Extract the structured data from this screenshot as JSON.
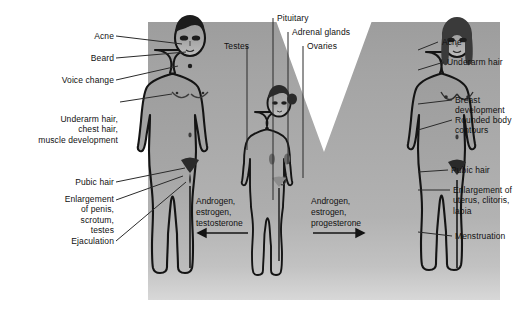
{
  "figure": {
    "background_color": "#a8a8a8",
    "page_background": "#ffffff",
    "outline_color": "#111111"
  },
  "left_labels": [
    {
      "id": "acne",
      "text": "Acne"
    },
    {
      "id": "beard",
      "text": "Beard"
    },
    {
      "id": "voice-change",
      "text": "Voice change"
    },
    {
      "id": "underarm-hair",
      "text": "Underarm hair,\nchest hair,\nmuscle development"
    },
    {
      "id": "pubic-hair",
      "text": "Pubic hair"
    },
    {
      "id": "enlargement",
      "text": "Enlargement\nof penis,\nscrotum,\ntestes"
    },
    {
      "id": "ejaculation",
      "text": "Ejaculation"
    }
  ],
  "right_labels": [
    {
      "id": "acne",
      "text": "Acne"
    },
    {
      "id": "underarm-hair",
      "text": "Underarm hair"
    },
    {
      "id": "breast-development",
      "text": "Breast\ndevelopment"
    },
    {
      "id": "rounded-body-contours",
      "text": "Rounded body\ncontours"
    },
    {
      "id": "pubic-hair",
      "text": "Pubic hair"
    },
    {
      "id": "enlargement",
      "text": "Enlargement of\nuterus, clitoris,\nlabia"
    },
    {
      "id": "menstruation",
      "text": "Menstruation"
    }
  ],
  "top_labels": [
    {
      "id": "testes",
      "text": "Testes"
    },
    {
      "id": "pituitary",
      "text": "Pituitary"
    },
    {
      "id": "adrenal-glands",
      "text": "Adrenal glands"
    },
    {
      "id": "ovaries",
      "text": "Ovaries"
    }
  ],
  "hormones": {
    "male": {
      "text": "Androgen,\nestrogen,\ntestosterone",
      "arrow": "left"
    },
    "female": {
      "text": "Androgen,\nestrogen,\nprogesterone",
      "arrow": "right"
    }
  },
  "figures": [
    {
      "id": "adult-male",
      "label": "adult male figure"
    },
    {
      "id": "child",
      "label": "child figure"
    },
    {
      "id": "adult-female",
      "label": "adult female figure"
    }
  ]
}
